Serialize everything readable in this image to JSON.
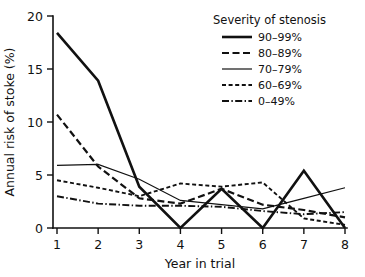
{
  "chart_data": {
    "type": "line",
    "title": "",
    "xlabel": "Year in trial",
    "ylabel": "Annual risk of stoke (%)",
    "x": [
      1,
      2,
      3,
      4,
      5,
      6,
      7,
      8
    ],
    "xtick_labels": [
      "1",
      "2",
      "3",
      "4",
      "5",
      "6",
      "7",
      "8"
    ],
    "ytick_labels": [
      "0",
      "5",
      "10",
      "15",
      "20"
    ],
    "yticks": [
      0,
      5,
      10,
      15,
      20
    ],
    "xlim": [
      1,
      8
    ],
    "ylim": [
      0,
      20
    ],
    "grid": false,
    "legend_position": "upper-right",
    "legend_title": "Severity of stenosis",
    "series": [
      {
        "name": "90-99%",
        "label": "90–99%",
        "style": "solid-thick",
        "color": "#111111",
        "values": [
          18.4,
          13.9,
          3.9,
          0.0,
          3.7,
          0.0,
          5.4,
          0.0
        ]
      },
      {
        "name": "80-89%",
        "label": "80–89%",
        "style": "dashed-long",
        "color": "#111111",
        "values": [
          10.7,
          5.8,
          2.8,
          2.3,
          3.7,
          2.2,
          1.7,
          1.0
        ]
      },
      {
        "name": "70-79%",
        "label": "70–79%",
        "style": "solid-thin",
        "color": "#111111",
        "values": [
          5.9,
          6.0,
          4.6,
          2.6,
          2.2,
          1.8,
          2.8,
          3.8
        ]
      },
      {
        "name": "60-69%",
        "label": "60–69%",
        "style": "dashed-short",
        "color": "#111111",
        "values": [
          4.5,
          3.8,
          3.0,
          4.2,
          3.9,
          4.3,
          0.9,
          0.3
        ]
      },
      {
        "name": "0-49%",
        "label": "0–49%",
        "style": "dash-dot",
        "color": "#111111",
        "values": [
          3.0,
          2.3,
          2.1,
          2.1,
          2.0,
          1.6,
          1.3,
          1.5
        ]
      }
    ]
  }
}
